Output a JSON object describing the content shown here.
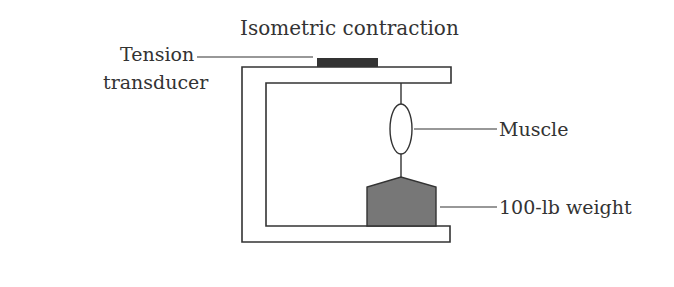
{
  "title": "Isometric contraction",
  "labels": {
    "transducer_line1": "Tension",
    "transducer_line2": "transducer",
    "muscle": "Muscle",
    "weight": "100-lb weight"
  },
  "colors": {
    "line": "#333333",
    "transducer_fill": "#333333",
    "weight_fill": "#777777"
  }
}
